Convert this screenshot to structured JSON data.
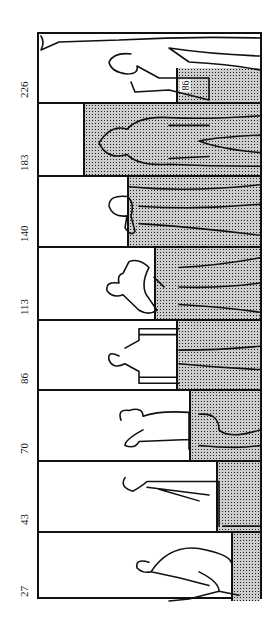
{
  "figure": {
    "panels": [
      {
        "depth_label": "226",
        "water_fraction": 0.38,
        "inner_label": "86"
      },
      {
        "depth_label": "183",
        "water_fraction": 0.8
      },
      {
        "depth_label": "140",
        "water_fraction": 0.6
      },
      {
        "depth_label": "113",
        "water_fraction": 0.48
      },
      {
        "depth_label": "86",
        "water_fraction": 0.38
      },
      {
        "depth_label": "70",
        "water_fraction": 0.32
      },
      {
        "depth_label": "43",
        "water_fraction": 0.2
      },
      {
        "depth_label": "27",
        "water_fraction": 0.13
      }
    ]
  }
}
